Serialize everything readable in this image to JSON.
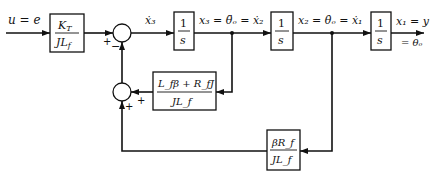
{
  "diagram": {
    "input_label": "u = e",
    "output_label_1": "x₁ = y",
    "output_label_2": "= θₒ",
    "blocks": {
      "gain": {
        "num": "K_T",
        "num_main": "K",
        "num_sub": "T",
        "den": "JL_f",
        "den_main": "JL",
        "den_sub": "f"
      },
      "int1": {
        "num": "1",
        "den": "s"
      },
      "int2": {
        "num": "1",
        "den": "s"
      },
      "int3": {
        "num": "1",
        "den": "s"
      },
      "fb_inner": {
        "num": "L_fβ + R_fJ",
        "den": "JL_f"
      },
      "fb_outer": {
        "num": "βR_f",
        "den": "JL_f"
      }
    },
    "signals": {
      "x3dot": "ẋ₃",
      "x3": "x₃ = θ̈ₒ = ẋ₂",
      "x2": "x₂ = θ̇ₒ = ẋ₁"
    },
    "sum1_signs": {
      "left": "+",
      "bottom": "−"
    },
    "sum2_signs": {
      "right": "+",
      "bottom": "+"
    },
    "colors": {
      "line": "#111111",
      "background": "#ffffff"
    }
  }
}
